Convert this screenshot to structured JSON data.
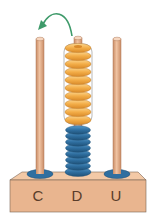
{
  "rods": [
    {
      "id": "C",
      "label": "C",
      "x": 40,
      "beads": []
    },
    {
      "id": "D",
      "label": "D",
      "x": 78,
      "beads": [
        {
          "color": "orange",
          "count": 10
        },
        {
          "color": "blue",
          "count": 8
        }
      ]
    },
    {
      "id": "U",
      "label": "U",
      "x": 117,
      "beads": []
    }
  ],
  "arrow": {
    "from": "D",
    "to": "C",
    "color": "#3e9a6a",
    "meaning": "10 tens move to hundreds"
  },
  "colors": {
    "rod": "#e7b08e",
    "rod_shadow": "#c98c66",
    "base_front": "#e9b58f",
    "base_top": "#f3c9a6",
    "bead_orange": "#f2ab45",
    "bead_orange_light": "#fbd488",
    "bead_blue": "#2f6fa0",
    "bead_blue_light": "#4f93c4",
    "washer": "#2f6fa0",
    "outline": "#6b5a4d"
  }
}
